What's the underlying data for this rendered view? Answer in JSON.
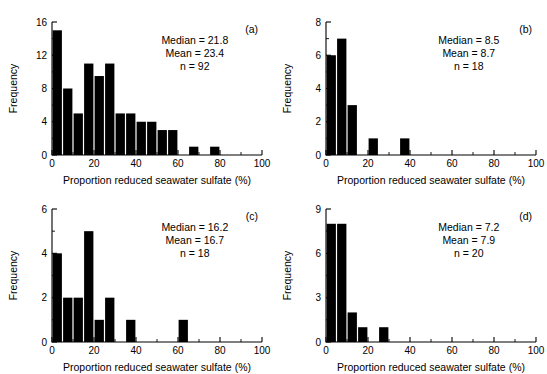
{
  "figure": {
    "background_color": "#ffffff",
    "bar_color": "#000000",
    "axis_color": "#000000",
    "shared_xlabel": "Proportion reduced seawater sulfate (%)",
    "shared_ylabel": "Frequency"
  },
  "chart_data": [
    {
      "type": "bar",
      "panel": "a",
      "panel_label": "(a)",
      "title": "",
      "xlabel": "Proportion reduced seawater sulfate (%)",
      "ylabel": "Frequency",
      "xlim": [
        0,
        100
      ],
      "ylim": [
        0,
        16
      ],
      "xticks": [
        0,
        20,
        40,
        60,
        80,
        100
      ],
      "xtick_labels": [
        "0",
        "20",
        "40",
        "60",
        "80",
        "100"
      ],
      "xminor_ticks": [
        10,
        30,
        50,
        70,
        90
      ],
      "yticks": [
        0,
        4,
        8,
        12,
        16
      ],
      "ytick_labels": [
        "0",
        "4",
        "8",
        "12",
        "16"
      ],
      "grid": false,
      "bin_width": 5,
      "bin_starts": [
        0,
        5,
        10,
        15,
        20,
        25,
        30,
        35,
        40,
        45,
        50,
        55,
        65,
        75
      ],
      "categories": [
        "0-5",
        "5-10",
        "10-15",
        "15-20",
        "20-25",
        "25-30",
        "30-35",
        "35-40",
        "40-45",
        "45-50",
        "50-55",
        "55-60",
        "65-70",
        "75-80"
      ],
      "values": [
        15,
        8,
        5,
        11,
        9.5,
        11,
        5,
        5,
        4,
        4,
        3,
        3,
        1,
        1
      ],
      "annotations": {
        "median_label": "Median = 21.8",
        "mean_label": "Mean = 23.4",
        "n_label": "n = 92",
        "median": 21.8,
        "mean": 23.4,
        "n": 92
      }
    },
    {
      "type": "bar",
      "panel": "b",
      "panel_label": "(b)",
      "title": "",
      "xlabel": "Proportion reduced seawater sulfate (%)",
      "ylabel": "Frequency",
      "xlim": [
        0,
        100
      ],
      "ylim": [
        0,
        8
      ],
      "xticks": [
        0,
        20,
        40,
        60,
        80,
        100
      ],
      "xtick_labels": [
        "0",
        "20",
        "40",
        "60",
        "80",
        "100"
      ],
      "xminor_ticks": [
        10,
        30,
        50,
        70,
        90
      ],
      "yticks": [
        0,
        2,
        4,
        6,
        8
      ],
      "ytick_labels": [
        "0",
        "2",
        "4",
        "6",
        "8"
      ],
      "grid": false,
      "bin_width": 5,
      "bin_starts": [
        0,
        5,
        10,
        20,
        35
      ],
      "categories": [
        "0-5",
        "5-10",
        "10-15",
        "20-25",
        "35-40"
      ],
      "values": [
        6,
        7,
        3,
        1,
        1
      ],
      "annotations": {
        "median_label": "Median = 8.5",
        "mean_label": "Mean = 8.7",
        "n_label": "n = 18",
        "median": 8.5,
        "mean": 8.7,
        "n": 18
      }
    },
    {
      "type": "bar",
      "panel": "c",
      "panel_label": "(c)",
      "title": "",
      "xlabel": "Proportion reduced seawater sulfate (%)",
      "ylabel": "Frequency",
      "xlim": [
        0,
        100
      ],
      "ylim": [
        0,
        6
      ],
      "xticks": [
        0,
        20,
        40,
        60,
        80,
        100
      ],
      "xtick_labels": [
        "0",
        "20",
        "40",
        "60",
        "80",
        "100"
      ],
      "xminor_ticks": [
        10,
        30,
        50,
        70,
        90
      ],
      "yticks": [
        0,
        2,
        4,
        6
      ],
      "ytick_labels": [
        "0",
        "2",
        "4",
        "6"
      ],
      "grid": false,
      "bin_width": 5,
      "bin_starts": [
        0,
        5,
        10,
        15,
        20,
        25,
        35,
        60
      ],
      "categories": [
        "0-5",
        "5-10",
        "10-15",
        "15-20",
        "20-25",
        "25-30",
        "35-40",
        "60-65"
      ],
      "values": [
        4,
        2,
        2,
        5,
        1,
        2,
        1,
        1
      ],
      "annotations": {
        "median_label": "Median = 16.2",
        "mean_label": "Mean = 16.7",
        "n_label": "n = 18",
        "median": 16.2,
        "mean": 16.7,
        "n": 18
      }
    },
    {
      "type": "bar",
      "panel": "d",
      "panel_label": "(d)",
      "title": "",
      "xlabel": "Proportion reduced seawater sulfate (%)",
      "ylabel": "Frequency",
      "xlim": [
        0,
        100
      ],
      "ylim": [
        0,
        9
      ],
      "xticks": [
        0,
        20,
        40,
        60,
        80,
        100
      ],
      "xtick_labels": [
        "0",
        "20",
        "40",
        "60",
        "80",
        "100"
      ],
      "xminor_ticks": [
        10,
        30,
        50,
        70,
        90
      ],
      "yticks": [
        0,
        3,
        6,
        9
      ],
      "ytick_labels": [
        "0",
        "3",
        "6",
        "9"
      ],
      "grid": false,
      "bin_width": 5,
      "bin_starts": [
        0,
        5,
        10,
        15,
        25
      ],
      "categories": [
        "0-5",
        "5-10",
        "10-15",
        "15-20",
        "25-30"
      ],
      "values": [
        8,
        8,
        2,
        1,
        1
      ],
      "annotations": {
        "median_label": "Median = 7.2",
        "mean_label": "Mean = 7.9",
        "n_label": "n = 20",
        "median": 7.2,
        "mean": 7.9,
        "n": 20
      }
    }
  ]
}
